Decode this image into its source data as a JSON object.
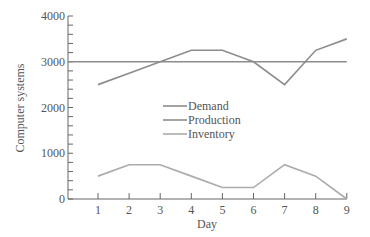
{
  "chart_data": {
    "type": "line",
    "title": "",
    "xlabel": "Day",
    "ylabel": "Computer systems",
    "x": [
      1,
      2,
      3,
      4,
      5,
      6,
      7,
      8,
      9
    ],
    "xticks": [
      "1",
      "2",
      "3",
      "4",
      "5",
      "6",
      "7",
      "8",
      "9"
    ],
    "yticks": [
      "0",
      "1000",
      "2000",
      "3000",
      "4000"
    ],
    "ylim": [
      0,
      4000
    ],
    "grid": false,
    "legend_position": "center",
    "series": [
      {
        "name": "Demand",
        "color": "#8c8c8c",
        "values": [
          2500,
          2750,
          3000,
          3250,
          3250,
          3000,
          2500,
          3250,
          3500
        ]
      },
      {
        "name": "Production",
        "color": "#8c8c8c",
        "values": [
          3000,
          3000,
          3000,
          3000,
          3000,
          3000,
          3000,
          3000,
          3000
        ]
      },
      {
        "name": "Inventory",
        "color": "#ababab",
        "values": [
          500,
          750,
          750,
          500,
          250,
          250,
          750,
          500,
          0
        ]
      }
    ]
  }
}
